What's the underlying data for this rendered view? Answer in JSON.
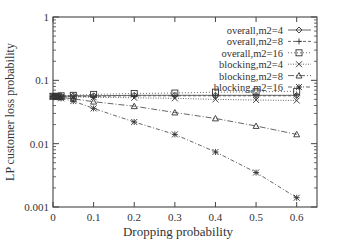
{
  "chart_data": {
    "type": "line",
    "title": "",
    "xlabel": "Dropping probability",
    "ylabel": "LP customer loss probability",
    "xlim": [
      0,
      0.65
    ],
    "ylim": [
      0.001,
      1
    ],
    "yscale": "log",
    "grid": false,
    "legend_position": "top-right",
    "x_ticks": [
      "0",
      "0.1",
      "0.2",
      "0.3",
      "0.4",
      "0.5",
      "0.6"
    ],
    "y_ticks": [
      "0.001",
      "0.01",
      "0.1",
      "1"
    ],
    "x": [
      0,
      0.01,
      0.02,
      0.05,
      0.1,
      0.2,
      0.3,
      0.4,
      0.5,
      0.6
    ],
    "series": [
      {
        "name": "overall,m2=4",
        "marker": "diamond",
        "dash": "",
        "values": [
          0.056,
          0.056,
          0.056,
          0.057,
          0.057,
          0.058,
          0.058,
          0.058,
          0.058,
          0.058
        ]
      },
      {
        "name": "overall,m2=8",
        "marker": "plus",
        "dash": "3,2",
        "values": [
          0.056,
          0.056,
          0.056,
          0.056,
          0.056,
          0.057,
          0.057,
          0.057,
          0.057,
          0.057
        ]
      },
      {
        "name": "overall,m2=16",
        "marker": "square",
        "dash": "1,2",
        "values": [
          0.056,
          0.056,
          0.057,
          0.058,
          0.06,
          0.062,
          0.063,
          0.065,
          0.066,
          0.067
        ]
      },
      {
        "name": "blocking,m2=4",
        "marker": "x",
        "dash": "1,1.5",
        "values": [
          0.056,
          0.056,
          0.055,
          0.055,
          0.054,
          0.053,
          0.052,
          0.05,
          0.049,
          0.048
        ]
      },
      {
        "name": "blocking,m2=8",
        "marker": "triangle",
        "dash": "6,2,1,2",
        "values": [
          0.056,
          0.055,
          0.054,
          0.051,
          0.046,
          0.039,
          0.031,
          0.025,
          0.019,
          0.014
        ]
      },
      {
        "name": "blocking,m2=16",
        "marker": "star",
        "dash": "4,2,1,2",
        "values": [
          0.056,
          0.054,
          0.052,
          0.047,
          0.036,
          0.022,
          0.014,
          0.0074,
          0.0035,
          0.0014
        ]
      }
    ]
  }
}
